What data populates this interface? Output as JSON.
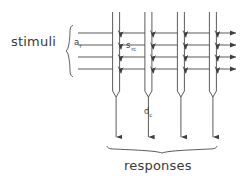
{
  "figure": {
    "type": "diagram",
    "title": "",
    "stroke_color": "#3f3f3f",
    "text_color": "#3a3a3a",
    "background_color": "#ffffff",
    "labels": {
      "stimuli": "stimuli",
      "responses": "responses",
      "afferent_var": "a",
      "afferent_sub": "r",
      "synapse_var": "s",
      "synapse_sub": "rc",
      "response_var": "d",
      "response_sub": "c"
    },
    "counts": {
      "stimulus_rows": 4,
      "columns": 4,
      "synapse_arrows": 16,
      "output_arrows": 4,
      "exit_arrows": 4
    },
    "geometry": {
      "row_y": [
        33,
        45,
        57,
        69
      ],
      "column_x": [
        116,
        148,
        181,
        213
      ],
      "column_top_y": 12,
      "column_bottom_y": 97,
      "column_width": 7,
      "line_start_x": 78,
      "line_end_x": 238,
      "output_arrow_end_y": 140,
      "left_brace_x": 68,
      "left_brace_top": 25,
      "left_brace_bottom": 77,
      "bottom_brace_y": 150,
      "bottom_brace_left": 107,
      "bottom_brace_right": 222
    }
  }
}
